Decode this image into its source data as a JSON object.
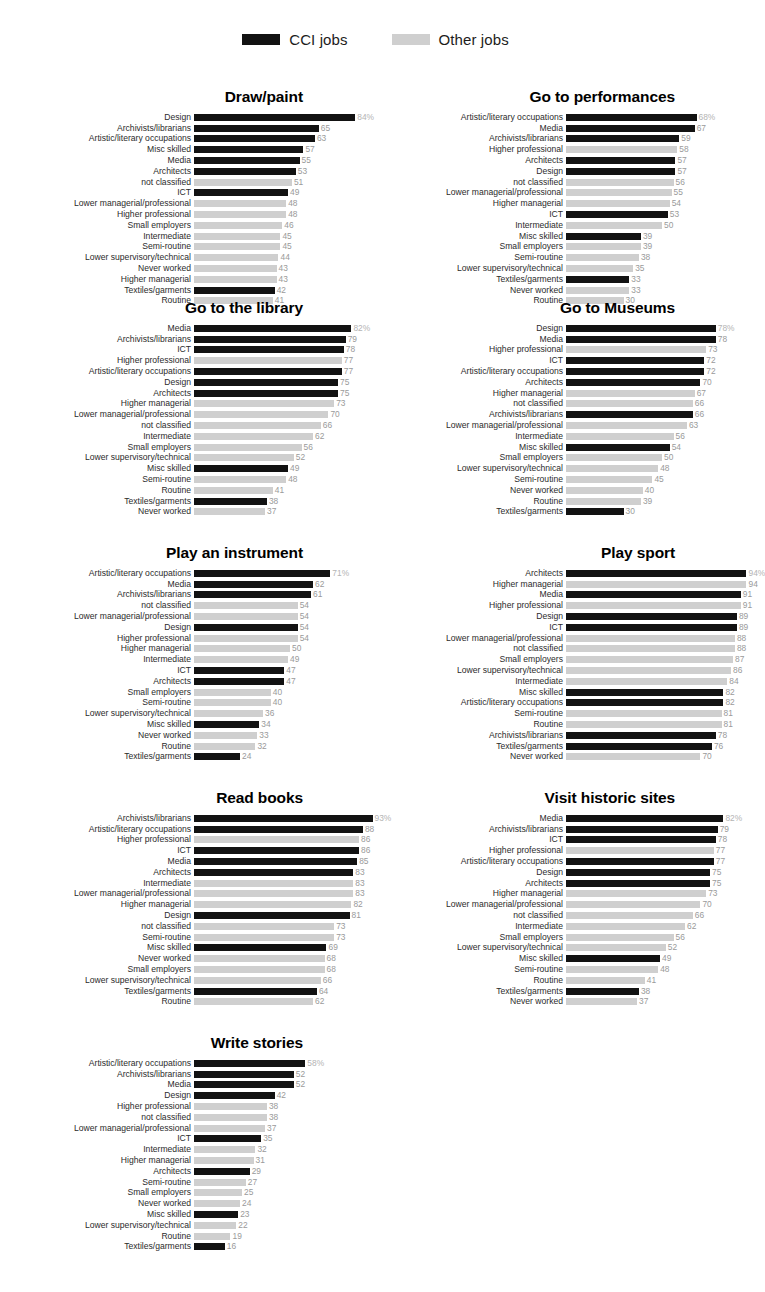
{
  "legend": {
    "items": [
      {
        "label": "CCI jobs",
        "key": "cci",
        "color": "#121212"
      },
      {
        "label": "Other jobs",
        "key": "other",
        "color": "#cfcfcf"
      }
    ]
  },
  "colors": {
    "cci": "#121212",
    "other": "#cfcfcf",
    "value_text": "#9a9a9a",
    "label_text": "#2b2b2b",
    "background": "#ffffff"
  },
  "chart_data": [
    {
      "type": "bar",
      "title": "Draw/paint",
      "orientation": "horizontal",
      "xlabel": "",
      "ylabel": "",
      "xlim": [
        0,
        100
      ],
      "grid": false,
      "unit": "%",
      "legend_position": "top-center",
      "categories": [
        "Design",
        "Archivists/librarians",
        "Artistic/literary occupations",
        "Misc skilled",
        "Media",
        "Architects",
        "not classified",
        "ICT",
        "Lower managerial/professional",
        "Higher professional",
        "Small employers",
        "Intermediate",
        "Semi-routine",
        "Lower supervisory/technical",
        "Never worked",
        "Higher managerial",
        "Textiles/garments",
        "Routine"
      ],
      "values": [
        84,
        65,
        63,
        57,
        55,
        53,
        51,
        49,
        48,
        48,
        46,
        45,
        45,
        44,
        43,
        43,
        42,
        41
      ],
      "value_labels": [
        "84%",
        "65",
        "63",
        "57",
        "55",
        "53",
        "51",
        "49",
        "48",
        "48",
        "46",
        "45",
        "45",
        "44",
        "43",
        "43",
        "42",
        "41"
      ],
      "groups": [
        "cci",
        "cci",
        "cci",
        "cci",
        "cci",
        "cci",
        "other",
        "cci",
        "other",
        "other",
        "other",
        "other",
        "other",
        "other",
        "other",
        "other",
        "cci",
        "other"
      ]
    },
    {
      "type": "bar",
      "title": "Go to performances",
      "orientation": "horizontal",
      "xlabel": "",
      "ylabel": "",
      "xlim": [
        0,
        100
      ],
      "grid": false,
      "unit": "%",
      "legend_position": "top-center",
      "categories": [
        "Artistic/literary occupations",
        "Media",
        "Archivists/librarians",
        "Higher professional",
        "Architects",
        "Design",
        "not classified",
        "Lower managerial/professional",
        "Higher managerial",
        "ICT",
        "Intermediate",
        "Misc skilled",
        "Small employers",
        "Semi-routine",
        "Lower supervisory/technical",
        "Textiles/garments",
        "Never worked",
        "Routine"
      ],
      "values": [
        68,
        67,
        59,
        58,
        57,
        57,
        56,
        55,
        54,
        53,
        50,
        39,
        39,
        38,
        35,
        33,
        33,
        30
      ],
      "value_labels": [
        "68%",
        "67",
        "59",
        "58",
        "57",
        "57",
        "56",
        "55",
        "54",
        "53",
        "50",
        "39",
        "39",
        "38",
        "35",
        "33",
        "33",
        "30"
      ],
      "groups": [
        "cci",
        "cci",
        "cci",
        "other",
        "cci",
        "cci",
        "other",
        "other",
        "other",
        "cci",
        "other",
        "cci",
        "other",
        "other",
        "other",
        "cci",
        "other",
        "other"
      ]
    },
    {
      "type": "bar",
      "title": "Go to the library",
      "orientation": "horizontal",
      "xlabel": "",
      "ylabel": "",
      "xlim": [
        0,
        100
      ],
      "grid": false,
      "unit": "%",
      "legend_position": "top-center",
      "categories": [
        "Media",
        "Archivists/librarians",
        "ICT",
        "Higher professional",
        "Artistic/literary occupations",
        "Design",
        "Architects",
        "Higher managerial",
        "Lower managerial/professional",
        "not classified",
        "Intermediate",
        "Small employers",
        "Lower supervisory/technical",
        "Misc skilled",
        "Semi-routine",
        "Routine",
        "Textiles/garments",
        "Never worked"
      ],
      "values": [
        82,
        79,
        78,
        77,
        77,
        75,
        75,
        73,
        70,
        66,
        62,
        56,
        52,
        49,
        48,
        41,
        38,
        37
      ],
      "value_labels": [
        "82%",
        "79",
        "78",
        "77",
        "77",
        "75",
        "75",
        "73",
        "70",
        "66",
        "62",
        "56",
        "52",
        "49",
        "48",
        "41",
        "38",
        "37"
      ],
      "groups": [
        "cci",
        "cci",
        "cci",
        "other",
        "cci",
        "cci",
        "cci",
        "other",
        "other",
        "other",
        "other",
        "other",
        "other",
        "cci",
        "other",
        "other",
        "cci",
        "other"
      ]
    },
    {
      "type": "bar",
      "title": "Go to Museums",
      "orientation": "horizontal",
      "xlabel": "",
      "ylabel": "",
      "xlim": [
        0,
        100
      ],
      "grid": false,
      "unit": "%",
      "legend_position": "top-center",
      "categories": [
        "Design",
        "Media",
        "Higher professional",
        "ICT",
        "Artistic/literary occupations",
        "Architects",
        "Higher managerial",
        "not classified",
        "Archivists/librarians",
        "Lower managerial/professional",
        "Intermediate",
        "Misc skilled",
        "Small employers",
        "Lower supervisory/technical",
        "Semi-routine",
        "Never worked",
        "Routine",
        "Textiles/garments"
      ],
      "values": [
        78,
        78,
        73,
        72,
        72,
        70,
        67,
        66,
        66,
        63,
        56,
        54,
        50,
        48,
        45,
        40,
        39,
        30
      ],
      "value_labels": [
        "78%",
        "78",
        "73",
        "72",
        "72",
        "70",
        "67",
        "66",
        "66",
        "63",
        "56",
        "54",
        "50",
        "48",
        "45",
        "40",
        "39",
        "30"
      ],
      "groups": [
        "cci",
        "cci",
        "other",
        "cci",
        "cci",
        "cci",
        "other",
        "other",
        "cci",
        "other",
        "other",
        "cci",
        "other",
        "other",
        "other",
        "other",
        "other",
        "cci"
      ]
    },
    {
      "type": "bar",
      "title": "Play an instrument",
      "orientation": "horizontal",
      "xlabel": "",
      "ylabel": "",
      "xlim": [
        0,
        100
      ],
      "grid": false,
      "unit": "%",
      "legend_position": "top-center",
      "categories": [
        "Artistic/literary occupations",
        "Media",
        "Archivists/librarians",
        "not classified",
        "Lower managerial/professional",
        "Design",
        "Higher professional",
        "Higher managerial",
        "Intermediate",
        "ICT",
        "Architects",
        "Small employers",
        "Semi-routine",
        "Lower supervisory/technical",
        "Misc skilled",
        "Never worked",
        "Routine",
        "Textiles/garments"
      ],
      "values": [
        71,
        62,
        61,
        54,
        54,
        54,
        54,
        50,
        49,
        47,
        47,
        40,
        40,
        36,
        34,
        33,
        32,
        24
      ],
      "value_labels": [
        "71%",
        "62",
        "61",
        "54",
        "54",
        "54",
        "54",
        "50",
        "49",
        "47",
        "47",
        "40",
        "40",
        "36",
        "34",
        "33",
        "32",
        "24"
      ],
      "groups": [
        "cci",
        "cci",
        "cci",
        "other",
        "other",
        "cci",
        "other",
        "other",
        "other",
        "cci",
        "cci",
        "other",
        "other",
        "other",
        "cci",
        "other",
        "other",
        "cci"
      ]
    },
    {
      "type": "bar",
      "title": "Play sport",
      "orientation": "horizontal",
      "xlabel": "",
      "ylabel": "",
      "xlim": [
        0,
        100
      ],
      "grid": false,
      "unit": "%",
      "legend_position": "top-center",
      "categories": [
        "Architects",
        "Higher managerial",
        "Media",
        "Higher professional",
        "Design",
        "ICT",
        "Lower managerial/professional",
        "not classified",
        "Small employers",
        "Lower supervisory/technical",
        "Intermediate",
        "Misc skilled",
        "Artistic/literary occupations",
        "Semi-routine",
        "Routine",
        "Archivists/librarians",
        "Textiles/garments",
        "Never worked"
      ],
      "values": [
        94,
        94,
        91,
        91,
        89,
        89,
        88,
        88,
        87,
        86,
        84,
        82,
        82,
        81,
        81,
        78,
        76,
        70
      ],
      "value_labels": [
        "94%",
        "94",
        "91",
        "91",
        "89",
        "89",
        "88",
        "88",
        "87",
        "86",
        "84",
        "82",
        "82",
        "81",
        "81",
        "78",
        "76",
        "70"
      ],
      "groups": [
        "cci",
        "other",
        "cci",
        "other",
        "cci",
        "cci",
        "other",
        "other",
        "other",
        "other",
        "other",
        "cci",
        "cci",
        "other",
        "other",
        "cci",
        "cci",
        "other"
      ]
    },
    {
      "type": "bar",
      "title": "Read books",
      "orientation": "horizontal",
      "xlabel": "",
      "ylabel": "",
      "xlim": [
        0,
        100
      ],
      "grid": false,
      "unit": "%",
      "legend_position": "top-center",
      "categories": [
        "Archivists/librarians",
        "Artistic/literary occupations",
        "Higher professional",
        "ICT",
        "Media",
        "Architects",
        "Intermediate",
        "Lower managerial/professional",
        "Higher managerial",
        "Design",
        "not classified",
        "Semi-routine",
        "Misc skilled",
        "Never worked",
        "Small employers",
        "Lower supervisory/technical",
        "Textiles/garments",
        "Routine"
      ],
      "values": [
        93,
        88,
        86,
        86,
        85,
        83,
        83,
        83,
        82,
        81,
        73,
        73,
        69,
        68,
        68,
        66,
        64,
        62
      ],
      "value_labels": [
        "93%",
        "88",
        "86",
        "86",
        "85",
        "83",
        "83",
        "83",
        "82",
        "81",
        "73",
        "73",
        "69",
        "68",
        "68",
        "66",
        "64",
        "62"
      ],
      "groups": [
        "cci",
        "cci",
        "other",
        "cci",
        "cci",
        "cci",
        "other",
        "other",
        "other",
        "cci",
        "other",
        "other",
        "cci",
        "other",
        "other",
        "other",
        "cci",
        "other"
      ]
    },
    {
      "type": "bar",
      "title": "Visit historic sites",
      "orientation": "horizontal",
      "xlabel": "",
      "ylabel": "",
      "xlim": [
        0,
        100
      ],
      "grid": false,
      "unit": "%",
      "legend_position": "top-center",
      "categories": [
        "Media",
        "Archivists/librarians",
        "ICT",
        "Higher professional",
        "Artistic/literary occupations",
        "Design",
        "Architects",
        "Higher managerial",
        "Lower managerial/professional",
        "not classified",
        "Intermediate",
        "Small employers",
        "Lower supervisory/technical",
        "Misc skilled",
        "Semi-routine",
        "Routine",
        "Textiles/garments",
        "Never worked"
      ],
      "values": [
        82,
        79,
        78,
        77,
        77,
        75,
        75,
        73,
        70,
        66,
        62,
        56,
        52,
        49,
        48,
        41,
        38,
        37
      ],
      "value_labels": [
        "82%",
        "79",
        "78",
        "77",
        "77",
        "75",
        "75",
        "73",
        "70",
        "66",
        "62",
        "56",
        "52",
        "49",
        "48",
        "41",
        "38",
        "37"
      ],
      "groups": [
        "cci",
        "cci",
        "cci",
        "other",
        "cci",
        "cci",
        "cci",
        "other",
        "other",
        "other",
        "other",
        "other",
        "other",
        "cci",
        "other",
        "other",
        "cci",
        "other"
      ]
    },
    {
      "type": "bar",
      "title": "Write stories",
      "orientation": "horizontal",
      "xlabel": "",
      "ylabel": "",
      "xlim": [
        0,
        100
      ],
      "grid": false,
      "unit": "%",
      "legend_position": "top-center",
      "categories": [
        "Artistic/literary occupations",
        "Archivists/librarians",
        "Media",
        "Design",
        "Higher professional",
        "not classified",
        "Lower managerial/professional",
        "ICT",
        "Intermediate",
        "Higher managerial",
        "Architects",
        "Semi-routine",
        "Small employers",
        "Never worked",
        "Misc skilled",
        "Lower supervisory/technical",
        "Routine",
        "Textiles/garments"
      ],
      "values": [
        58,
        52,
        52,
        42,
        38,
        38,
        37,
        35,
        32,
        31,
        29,
        27,
        25,
        24,
        23,
        22,
        19,
        16
      ],
      "value_labels": [
        "58%",
        "52",
        "52",
        "42",
        "38",
        "38",
        "37",
        "35",
        "32",
        "31",
        "29",
        "27",
        "25",
        "24",
        "23",
        "22",
        "19",
        "16"
      ],
      "groups": [
        "cci",
        "cci",
        "cci",
        "cci",
        "other",
        "other",
        "other",
        "cci",
        "other",
        "other",
        "cci",
        "other",
        "other",
        "other",
        "cci",
        "other",
        "other",
        "cci"
      ]
    }
  ]
}
